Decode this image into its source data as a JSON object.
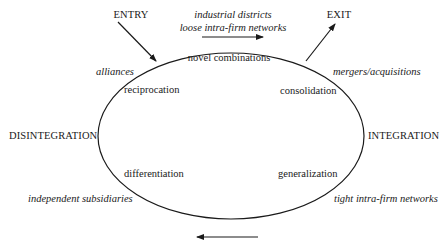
{
  "diagram": {
    "type": "cycle",
    "nodes": {
      "entry": "ENTRY",
      "exit": "EXIT",
      "disintegration": "DISINTEGRATION",
      "integration": "INTEGRATION"
    },
    "phases": {
      "novel_combinations": "novel combinations",
      "reciprocation": "reciprocation",
      "consolidation": "consolidation",
      "differentiation": "differentiation",
      "generalization": "generalization"
    },
    "forms": {
      "top_line1": "industrial districts",
      "top_line2": "loose intra-firm networks",
      "alliances": "alliances",
      "mergers": "mergers/acquisitions",
      "independent": "independent subsidiaries",
      "tight": "tight intra-firm networks"
    },
    "flow_direction": {
      "top": "left-to-right",
      "bottom": "right-to-left"
    },
    "stroke_color": "#1a1a1a"
  }
}
